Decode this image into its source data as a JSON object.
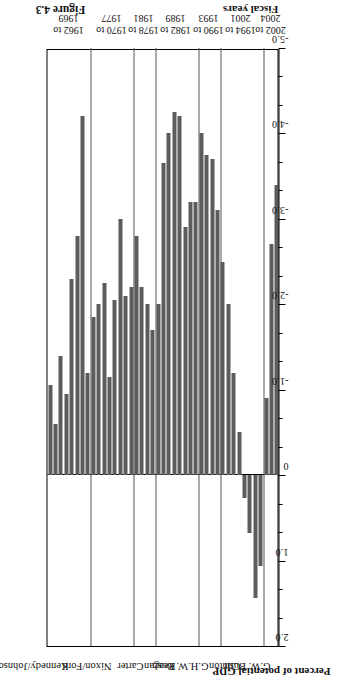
{
  "figure": {
    "caption": "Figure 4.3",
    "value_axis_title": "Percent of potential GDP",
    "category_axis_title": "Fiscal years"
  },
  "chart_data": {
    "type": "bar",
    "orientation": "horizontal-rotated",
    "title": "",
    "xlabel": "Fiscal years",
    "ylabel": "Percent of potential GDP",
    "ylim": [
      2.0,
      -5.0
    ],
    "grid": false,
    "legend": "none",
    "tick_labels": [
      "2.0",
      "1.0",
      "0",
      "-1.0",
      "-2.0",
      "-3.0",
      "-4.0",
      "-5.0"
    ],
    "tick_values": [
      2.0,
      1.0,
      0,
      -1.0,
      -2.0,
      -3.0,
      -4.0,
      -5.0
    ],
    "minor_ticks_per_interval": 2,
    "groups": [
      {
        "president": "Kennedy/Johnson",
        "years_label_line1": "1962 to",
        "years_label_line2": "1969"
      },
      {
        "president": "Nixon/Ford",
        "years_label_line1": "1970 to",
        "years_label_line2": "1977"
      },
      {
        "president": "Carter",
        "years_label_line1": "1978 to",
        "years_label_line2": "1981"
      },
      {
        "president": "Reagan",
        "years_label_line1": "1982 to",
        "years_label_line2": "1989"
      },
      {
        "president": "G.H.W. Bush",
        "years_label_line1": "1990 to",
        "years_label_line2": "1993"
      },
      {
        "president": "Clinton",
        "years_label_line1": "1994 to",
        "years_label_line2": "2001"
      },
      {
        "president": "G.W. Bush",
        "years_label_line1": "2002 to",
        "years_label_line2": "2004"
      }
    ],
    "categories": [
      "1962",
      "1963",
      "1964",
      "1965",
      "1966",
      "1967",
      "1968",
      "1969",
      "1970",
      "1971",
      "1972",
      "1973",
      "1974",
      "1975",
      "1976",
      "1977",
      "1978",
      "1979",
      "1980",
      "1981",
      "1982",
      "1983",
      "1984",
      "1985",
      "1986",
      "1987",
      "1988",
      "1989",
      "1990",
      "1991",
      "1992",
      "1993",
      "1994",
      "1995",
      "1996",
      "1997",
      "1998",
      "1999",
      "2000",
      "2001",
      "2002",
      "2003",
      "2004"
    ],
    "values": [
      -1.05,
      -0.6,
      -1.4,
      -0.95,
      -2.3,
      -2.8,
      -4.2,
      -1.2,
      -1.85,
      -2.0,
      -2.25,
      -1.15,
      -2.05,
      -3.0,
      -2.1,
      -2.2,
      -2.8,
      -2.2,
      -2.0,
      -1.7,
      -2.0,
      -3.65,
      -4.0,
      -4.25,
      -4.2,
      -2.9,
      -3.2,
      -3.2,
      -4.0,
      -3.75,
      -3.7,
      -3.1,
      -2.5,
      -2.0,
      -1.2,
      -0.5,
      0.27,
      0.68,
      1.44,
      1.06,
      -0.9,
      -2.7,
      -3.4
    ],
    "bar_color": "#5c5c5c",
    "group_sizes": [
      8,
      8,
      4,
      8,
      4,
      8,
      3
    ]
  }
}
